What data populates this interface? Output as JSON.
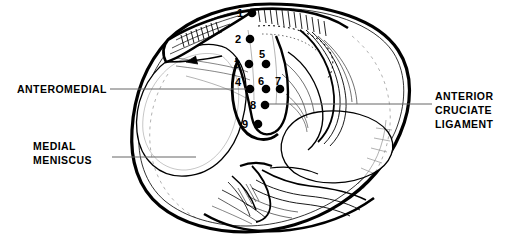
{
  "figure": {
    "view": "superior view of right tibial plateau",
    "line_color": "#000000",
    "background_color": "#ffffff"
  },
  "labels": {
    "anteromedial": "ANTEROMEDIAL",
    "medial_meniscus": "MEDIAL\nMENISCUS",
    "anterior_cruciate_ligament": "ANTERIOR\nCRUCIATE\nLIGAMENT"
  },
  "points": [
    {
      "id": 1,
      "label": "1",
      "x": 252,
      "y": 13,
      "label_x": 240,
      "label_y": 17
    },
    {
      "id": 2,
      "label": "2",
      "x": 250,
      "y": 39,
      "label_x": 238,
      "label_y": 43
    },
    {
      "id": 3,
      "label": "3",
      "x": 249,
      "y": 64,
      "label_x": 237,
      "label_y": 68
    },
    {
      "id": 4,
      "label": "4",
      "x": 250,
      "y": 89,
      "label_x": 238,
      "label_y": 86
    },
    {
      "id": 5,
      "label": "5",
      "x": 266,
      "y": 64,
      "label_x": 262,
      "label_y": 55
    },
    {
      "id": 6,
      "label": "6",
      "x": 266,
      "y": 89,
      "label_x": 261,
      "label_y": 85
    },
    {
      "id": 7,
      "label": "7",
      "x": 280,
      "y": 89,
      "label_x": 278,
      "label_y": 85
    },
    {
      "id": 8,
      "label": "8",
      "x": 265,
      "y": 105,
      "label_x": 253,
      "label_y": 109
    },
    {
      "id": 9,
      "label": "9",
      "x": 258,
      "y": 124,
      "label_x": 245,
      "label_y": 128
    }
  ],
  "leader_lines": [
    {
      "name": "anteromedial-leader",
      "x1": 110,
      "y1": 89,
      "x2": 250,
      "y2": 89
    },
    {
      "name": "medial-meniscus-leader",
      "x1": 112,
      "y1": 157,
      "x2": 196,
      "y2": 157
    },
    {
      "name": "acl-leader",
      "x1": 268,
      "y1": 104,
      "x2": 432,
      "y2": 104
    }
  ]
}
